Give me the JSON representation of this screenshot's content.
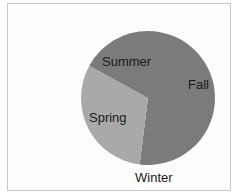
{
  "chart_data": {
    "type": "pie",
    "title": "",
    "categories": [
      "Fall",
      "Winter",
      "Spring",
      "Summer"
    ],
    "values": [
      52,
      0,
      31,
      17
    ],
    "colors": [
      "#7b7b7b",
      "#7b7b7b",
      "#a9a9a9",
      "#7b7b7b"
    ],
    "start_angle_deg": 0,
    "direction": "clockwise",
    "legend": "none",
    "data_labels": [
      "Fall",
      "Winter",
      "Spring",
      "Summer"
    ]
  },
  "labels": {
    "summer": "Summer",
    "fall": "Fall",
    "spring": "Spring",
    "winter": "Winter"
  }
}
